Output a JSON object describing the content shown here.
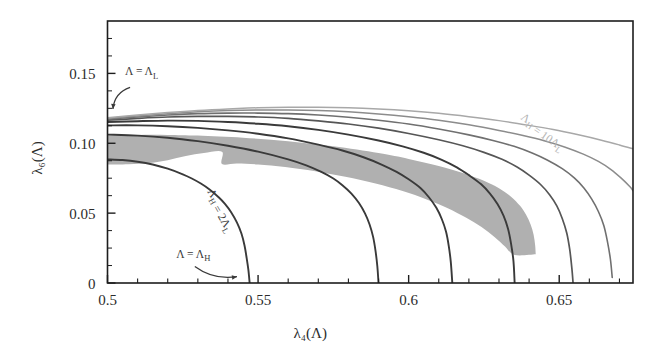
{
  "figure": {
    "background_color": "#ffffff",
    "frame_color": "#1d1d1d",
    "band_color": "#b0b0b0"
  },
  "chart_data": {
    "type": "line",
    "title": "",
    "xlabel": "λ₄(Λ)",
    "ylabel": "λ₆(Λ)",
    "xlim": [
      0.5,
      0.6745
    ],
    "ylim": [
      0.0,
      0.1875
    ],
    "grid": false,
    "legend_position": "inline-annotations",
    "xticks_major": [
      0.5,
      0.55,
      0.6,
      0.65
    ],
    "xticks_major_labels": [
      "0.5",
      "0.55",
      "0.6",
      "0.65"
    ],
    "xticks_minor_step": 0.01,
    "yticks_major": [
      0,
      0.05,
      0.1,
      0.15
    ],
    "yticks_major_labels": [
      "0",
      "0.05",
      "0.10",
      "0.15"
    ],
    "series": [
      {
        "name": "ΛH = 2ΛL",
        "color": "#3a3a3a",
        "width": 1.9,
        "points": [
          [
            0.5,
            0.0885
          ],
          [
            0.505,
            0.088
          ],
          [
            0.51,
            0.0868
          ],
          [
            0.515,
            0.0848
          ],
          [
            0.52,
            0.0818
          ],
          [
            0.525,
            0.0778
          ],
          [
            0.528,
            0.0748
          ],
          [
            0.531,
            0.0712
          ],
          [
            0.534,
            0.0668
          ],
          [
            0.537,
            0.0612
          ],
          [
            0.539,
            0.0566
          ],
          [
            0.541,
            0.0508
          ],
          [
            0.543,
            0.0432
          ],
          [
            0.5445,
            0.0352
          ],
          [
            0.5455,
            0.0268
          ],
          [
            0.5462,
            0.018
          ],
          [
            0.5468,
            0.009
          ],
          [
            0.5472,
            0.0
          ]
        ]
      },
      {
        "name": "curve-3",
        "color": "#3a3a3a",
        "width": 1.9,
        "points": [
          [
            0.5,
            0.1062
          ],
          [
            0.51,
            0.1055
          ],
          [
            0.52,
            0.104
          ],
          [
            0.53,
            0.1015
          ],
          [
            0.54,
            0.0982
          ],
          [
            0.55,
            0.094
          ],
          [
            0.56,
            0.0885
          ],
          [
            0.566,
            0.0842
          ],
          [
            0.571,
            0.0795
          ],
          [
            0.575,
            0.0748
          ],
          [
            0.578,
            0.07
          ],
          [
            0.581,
            0.064
          ],
          [
            0.5835,
            0.0572
          ],
          [
            0.5855,
            0.0498
          ],
          [
            0.587,
            0.042
          ],
          [
            0.5882,
            0.033
          ],
          [
            0.589,
            0.023
          ],
          [
            0.5896,
            0.012
          ],
          [
            0.59,
            0.0
          ]
        ]
      },
      {
        "name": "curve-4",
        "color": "#3a3a3a",
        "width": 1.9,
        "points": [
          [
            0.5,
            0.1128
          ],
          [
            0.51,
            0.1128
          ],
          [
            0.52,
            0.1122
          ],
          [
            0.53,
            0.111
          ],
          [
            0.54,
            0.1092
          ],
          [
            0.55,
            0.1068
          ],
          [
            0.56,
            0.1035
          ],
          [
            0.57,
            0.099
          ],
          [
            0.578,
            0.0948
          ],
          [
            0.585,
            0.09
          ],
          [
            0.591,
            0.0848
          ],
          [
            0.596,
            0.0795
          ],
          [
            0.6,
            0.0742
          ],
          [
            0.604,
            0.0678
          ],
          [
            0.6068,
            0.0612
          ],
          [
            0.6092,
            0.0538
          ],
          [
            0.611,
            0.0458
          ],
          [
            0.6124,
            0.0368
          ],
          [
            0.6133,
            0.0268
          ],
          [
            0.614,
            0.015
          ],
          [
            0.6145,
            0.0
          ]
        ]
      },
      {
        "name": "curve-5",
        "color": "#3a3a3a",
        "width": 1.9,
        "points": [
          [
            0.5,
            0.1152
          ],
          [
            0.51,
            0.1158
          ],
          [
            0.52,
            0.1162
          ],
          [
            0.53,
            0.116
          ],
          [
            0.54,
            0.1152
          ],
          [
            0.55,
            0.114
          ],
          [
            0.56,
            0.1122
          ],
          [
            0.57,
            0.1096
          ],
          [
            0.58,
            0.1062
          ],
          [
            0.59,
            0.102
          ],
          [
            0.598,
            0.0978
          ],
          [
            0.605,
            0.0932
          ],
          [
            0.611,
            0.0882
          ],
          [
            0.616,
            0.0828
          ],
          [
            0.62,
            0.0772
          ],
          [
            0.624,
            0.0708
          ],
          [
            0.627,
            0.064
          ],
          [
            0.6295,
            0.0565
          ],
          [
            0.6315,
            0.0482
          ],
          [
            0.633,
            0.0388
          ],
          [
            0.634,
            0.0282
          ],
          [
            0.6348,
            0.0158
          ],
          [
            0.6352,
            0.0
          ]
        ]
      },
      {
        "name": "curve-6",
        "color": "#565656",
        "width": 1.7,
        "points": [
          [
            0.5,
            0.1165
          ],
          [
            0.51,
            0.1178
          ],
          [
            0.52,
            0.1188
          ],
          [
            0.53,
            0.1192
          ],
          [
            0.54,
            0.1192
          ],
          [
            0.55,
            0.1188
          ],
          [
            0.56,
            0.1178
          ],
          [
            0.57,
            0.116
          ],
          [
            0.58,
            0.1138
          ],
          [
            0.59,
            0.1108
          ],
          [
            0.6,
            0.107
          ],
          [
            0.61,
            0.1025
          ],
          [
            0.618,
            0.0982
          ],
          [
            0.625,
            0.0935
          ],
          [
            0.631,
            0.0885
          ],
          [
            0.636,
            0.083
          ],
          [
            0.64,
            0.0772
          ],
          [
            0.6438,
            0.0705
          ],
          [
            0.6468,
            0.0632
          ],
          [
            0.6492,
            0.0552
          ],
          [
            0.651,
            0.0462
          ],
          [
            0.6525,
            0.0358
          ],
          [
            0.6535,
            0.0238
          ],
          [
            0.6542,
            0.0105
          ],
          [
            0.6546,
            0.0
          ]
        ]
      },
      {
        "name": "curve-7",
        "color": "#707070",
        "width": 1.6,
        "points": [
          [
            0.5,
            0.1172
          ],
          [
            0.51,
            0.1188
          ],
          [
            0.52,
            0.1202
          ],
          [
            0.53,
            0.1212
          ],
          [
            0.54,
            0.1216
          ],
          [
            0.55,
            0.1216
          ],
          [
            0.56,
            0.1212
          ],
          [
            0.57,
            0.1202
          ],
          [
            0.58,
            0.1186
          ],
          [
            0.59,
            0.1165
          ],
          [
            0.6,
            0.1138
          ],
          [
            0.61,
            0.1102
          ],
          [
            0.62,
            0.106
          ],
          [
            0.628,
            0.102
          ],
          [
            0.635,
            0.0978
          ],
          [
            0.641,
            0.093
          ],
          [
            0.646,
            0.088
          ],
          [
            0.651,
            0.0818
          ],
          [
            0.655,
            0.0752
          ],
          [
            0.6582,
            0.068
          ],
          [
            0.6608,
            0.06
          ],
          [
            0.663,
            0.0512
          ],
          [
            0.6648,
            0.0412
          ],
          [
            0.666,
            0.0298
          ],
          [
            0.667,
            0.017
          ],
          [
            0.6676,
            0.004
          ]
        ]
      },
      {
        "name": "curve-8",
        "color": "#8c8c8c",
        "width": 1.5,
        "points": [
          [
            0.5,
            0.1178
          ],
          [
            0.51,
            0.1196
          ],
          [
            0.52,
            0.1212
          ],
          [
            0.53,
            0.1225
          ],
          [
            0.54,
            0.1234
          ],
          [
            0.55,
            0.1238
          ],
          [
            0.56,
            0.1238
          ],
          [
            0.57,
            0.1234
          ],
          [
            0.58,
            0.1225
          ],
          [
            0.59,
            0.121
          ],
          [
            0.6,
            0.119
          ],
          [
            0.61,
            0.1165
          ],
          [
            0.62,
            0.1132
          ],
          [
            0.63,
            0.1092
          ],
          [
            0.638,
            0.1055
          ],
          [
            0.645,
            0.1018
          ],
          [
            0.652,
            0.0972
          ],
          [
            0.658,
            0.0922
          ],
          [
            0.663,
            0.087
          ],
          [
            0.6672,
            0.0812
          ],
          [
            0.6705,
            0.0752
          ],
          [
            0.6735,
            0.0688
          ],
          [
            0.6745,
            0.066
          ]
        ]
      },
      {
        "name": "ΛH = 10ΛL",
        "color": "#a8a8a8",
        "width": 1.5,
        "points": [
          [
            0.5,
            0.1182
          ],
          [
            0.51,
            0.1202
          ],
          [
            0.52,
            0.122
          ],
          [
            0.53,
            0.1235
          ],
          [
            0.54,
            0.1246
          ],
          [
            0.55,
            0.1254
          ],
          [
            0.56,
            0.1258
          ],
          [
            0.57,
            0.1258
          ],
          [
            0.58,
            0.1254
          ],
          [
            0.59,
            0.1245
          ],
          [
            0.6,
            0.1232
          ],
          [
            0.61,
            0.1214
          ],
          [
            0.62,
            0.119
          ],
          [
            0.63,
            0.1162
          ],
          [
            0.64,
            0.1128
          ],
          [
            0.648,
            0.1098
          ],
          [
            0.656,
            0.1062
          ],
          [
            0.664,
            0.1022
          ],
          [
            0.67,
            0.0988
          ],
          [
            0.6745,
            0.096
          ]
        ]
      }
    ],
    "shaded_band": {
      "name": "allowed-region-band",
      "color": "#b0b0b0",
      "opacity": 1,
      "outer_edge": [
        [
          0.5,
          0.1055
        ],
        [
          0.51,
          0.106
        ],
        [
          0.52,
          0.106
        ],
        [
          0.53,
          0.1055
        ],
        [
          0.545,
          0.104
        ],
        [
          0.56,
          0.1015
        ],
        [
          0.575,
          0.0978
        ],
        [
          0.59,
          0.093
        ],
        [
          0.6,
          0.0888
        ],
        [
          0.61,
          0.0838
        ],
        [
          0.618,
          0.0788
        ],
        [
          0.625,
          0.0732
        ],
        [
          0.63,
          0.0678
        ],
        [
          0.634,
          0.0618
        ],
        [
          0.637,
          0.0552
        ],
        [
          0.639,
          0.0488
        ],
        [
          0.6405,
          0.0418
        ],
        [
          0.6415,
          0.0345
        ],
        [
          0.642,
          0.0272
        ],
        [
          0.6422,
          0.0205
        ]
      ],
      "inner_edge": [
        [
          0.6422,
          0.0205
        ],
        [
          0.6352,
          0.02
        ],
        [
          0.632,
          0.0262
        ],
        [
          0.6285,
          0.033
        ],
        [
          0.6242,
          0.04
        ],
        [
          0.619,
          0.0468
        ],
        [
          0.613,
          0.0535
        ],
        [
          0.606,
          0.0598
        ],
        [
          0.598,
          0.0658
        ],
        [
          0.589,
          0.0712
        ],
        [
          0.579,
          0.076
        ],
        [
          0.569,
          0.08
        ],
        [
          0.559,
          0.083
        ],
        [
          0.55,
          0.0848
        ],
        [
          0.543,
          0.0855
        ],
        [
          0.538,
          0.0852
        ],
        [
          0.538,
          0.094
        ],
        [
          0.532,
          0.093
        ],
        [
          0.526,
          0.0908
        ],
        [
          0.52,
          0.0878
        ],
        [
          0.514,
          0.0858
        ],
        [
          0.507,
          0.085
        ],
        [
          0.5,
          0.0848
        ]
      ]
    },
    "annotations": [
      {
        "name": "lambda-L-annotation",
        "text": "Λ = ΛL",
        "text_plain": "Λ = Λ",
        "subscript": "L",
        "x": 0.5058,
        "y": 0.1485,
        "rotation": 0,
        "color": "#3a3a3a",
        "arrow": {
          "from": [
            0.5075,
            0.14
          ],
          "to": [
            0.5018,
            0.1245
          ],
          "curved": true
        }
      },
      {
        "name": "lambda-H-annotation",
        "text": "Λ = ΛH",
        "text_plain": "Λ = Λ",
        "subscript": "H",
        "x": 0.5228,
        "y": 0.0182,
        "rotation": 0,
        "color": "#3a3a3a",
        "arrow": {
          "from": [
            0.529,
            0.0118
          ],
          "to": [
            0.543,
            0.0045
          ],
          "curved": true
        }
      },
      {
        "name": "lambda-H-2L-curve-label",
        "text": "ΛH = 2ΛL",
        "rotation": 60,
        "x": 0.533,
        "y": 0.0655,
        "color": "#3a3a3a"
      },
      {
        "name": "lambda-H-10L-curve-label",
        "text": "ΛH = 10ΛL",
        "rotation": 35,
        "x": 0.637,
        "y": 0.1175,
        "color": "#b4b4b4"
      }
    ]
  }
}
